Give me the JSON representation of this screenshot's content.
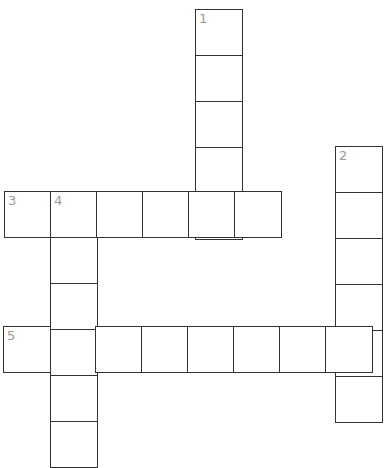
{
  "title_fragment": "",
  "colors": {
    "border": "#333333",
    "clue_number": "#9a9a9a",
    "background": "#ffffff"
  },
  "crossword": {
    "cell_size": 46,
    "entries": [
      {
        "number": "1",
        "direction": "down",
        "length": 5,
        "start": {
          "x": 195,
          "y": 9
        }
      },
      {
        "number": "2",
        "direction": "down",
        "length": 6,
        "start": {
          "x": 335,
          "y": 146
        }
      },
      {
        "number": "3",
        "direction": "across",
        "length": 6,
        "start": {
          "x": 4,
          "y": 191
        }
      },
      {
        "number": "4",
        "direction": "down",
        "length": 6,
        "start": {
          "x": 50,
          "y": 191
        }
      },
      {
        "number": "5",
        "direction": "across",
        "length": 8,
        "start": {
          "x": 3,
          "y": 326
        }
      }
    ]
  }
}
